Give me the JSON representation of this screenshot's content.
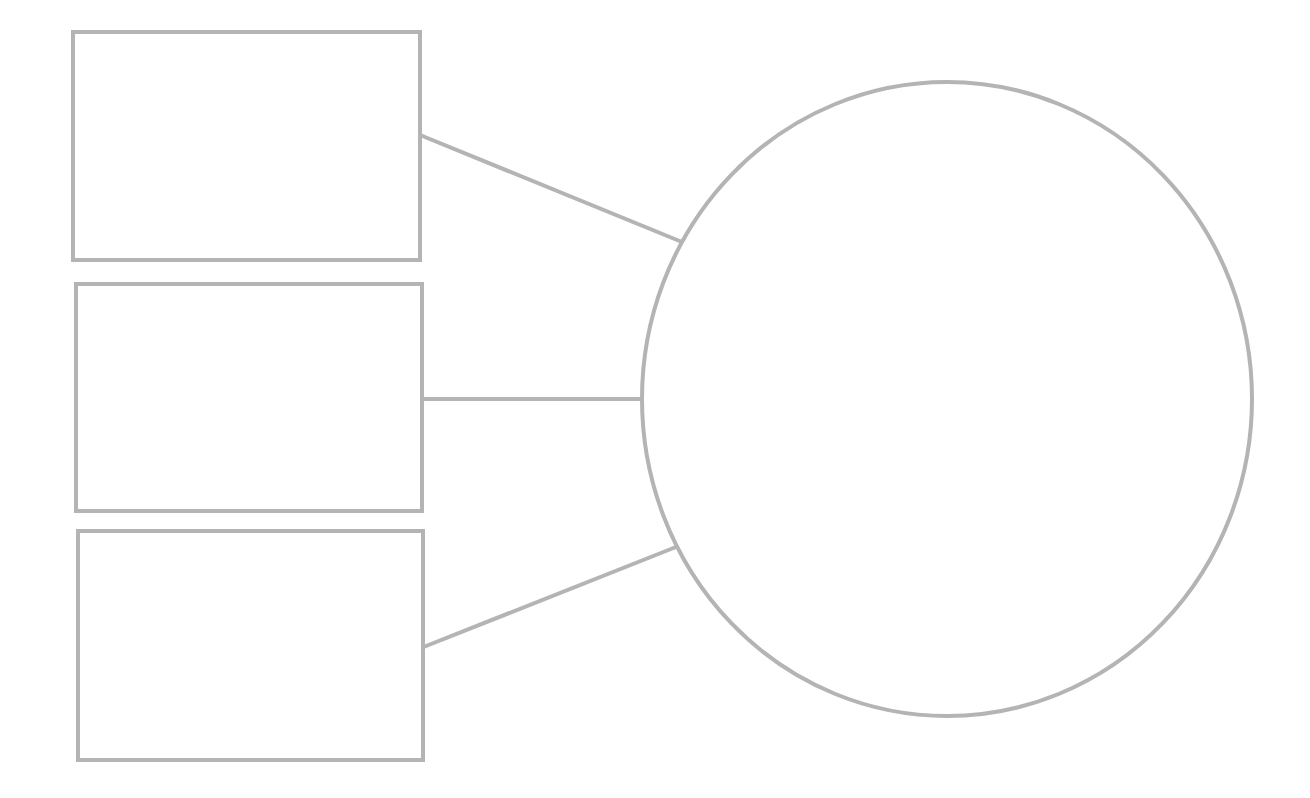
{
  "diagram": {
    "type": "blank-graphic-organizer",
    "stroke_color": "#b4b4b4",
    "stroke_width": 4,
    "background": "#ffffff",
    "central_node": {
      "shape": "ellipse",
      "label": "",
      "cx": 947,
      "cy": 399,
      "rx": 305,
      "ry": 317
    },
    "side_nodes": [
      {
        "shape": "rect",
        "label": "",
        "x": 73,
        "y": 32,
        "width": 347,
        "height": 228
      },
      {
        "shape": "rect",
        "label": "",
        "x": 76,
        "y": 284,
        "width": 346,
        "height": 227
      },
      {
        "shape": "rect",
        "label": "",
        "x": 78,
        "y": 531,
        "width": 345,
        "height": 229
      }
    ],
    "connectors": [
      {
        "from": "side_nodes.0",
        "to": "central_node",
        "x1": 420,
        "y1": 135,
        "x2": 682,
        "y2": 242
      },
      {
        "from": "side_nodes.1",
        "to": "central_node",
        "x1": 422,
        "y1": 399,
        "x2": 642,
        "y2": 399
      },
      {
        "from": "side_nodes.2",
        "to": "central_node",
        "x1": 421,
        "y1": 648,
        "x2": 676,
        "y2": 547
      }
    ]
  }
}
